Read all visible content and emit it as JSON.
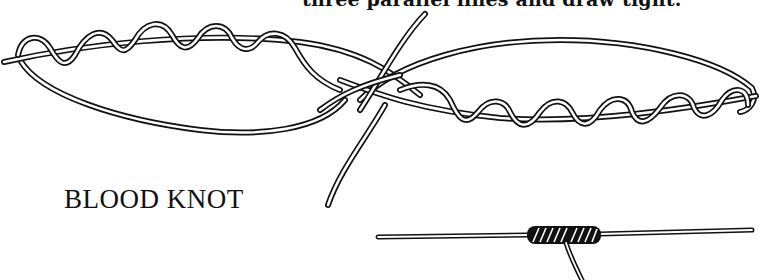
{
  "caption": {
    "text": "three parallel lines and draw tight."
  },
  "title": {
    "text": "BLOOD KNOT"
  },
  "figures": [
    {
      "name": "loose-knot-illustration",
      "description": "Two lines overlapped, each wrapped around the other five times with ends passed through center"
    },
    {
      "name": "tightened-knot-illustration",
      "description": "Finished blood knot drawn tight with tag end trimmed"
    }
  ],
  "colors": {
    "ink": "#111111",
    "paper": "#ffffff"
  }
}
